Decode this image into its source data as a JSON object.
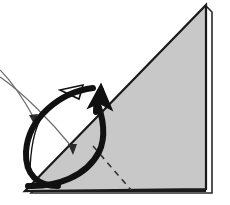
{
  "figure": {
    "canvas": {
      "width": 230,
      "height": 205
    },
    "background_color": "#ffffff"
  },
  "colors": {
    "paper_fill": "#c8c8c8",
    "paper_outline": "#1a1a1a",
    "back_sheet_fill": "#fdfdfd",
    "back_sheet_outline": "#2a2a2a",
    "crease_dashed": "#333333",
    "thick_arrow": "#111111",
    "thin_arrow": "#6b6b6b",
    "hollow_arrow_outline": "#111111",
    "hollow_arrow_fill": "#ffffff"
  },
  "shapes": {
    "back_sheet": {
      "name": "back-sheet",
      "points": "31,193 212,193 212,12 206,6",
      "note": "thin white layer of paper peeking behind the shaded triangle at the right edge"
    },
    "paper_triangle": {
      "name": "paper-triangle",
      "points": "25,191 206,5 206,189",
      "note": "main shaded right triangle; apex top-right, bottom-left corner, bottom-right corner"
    },
    "base_edge": {
      "name": "base-edge",
      "from": [
        25,
        191
      ],
      "to": [
        206,
        191
      ]
    },
    "crease_line": {
      "name": "crease-dashed-line",
      "from": [
        93,
        146
      ],
      "to": [
        131,
        190
      ],
      "dash": "6,5",
      "width": 1.6
    }
  },
  "arrows": {
    "thick_rotation_loop": {
      "name": "thick-rotation-arrow",
      "stroke_width": 6,
      "tip": [
        101,
        84
      ],
      "note": "heavy black looping arrow showing the paper rotating up and over"
    },
    "hollow_arrowhead": {
      "name": "hollow-arrowhead",
      "points": "83,85 60,90 79,99",
      "note": "small unfilled triangular arrowhead at top of thin loop"
    },
    "thin_loop": {
      "name": "thin-loop-arrow",
      "stroke_width": 1.3
    },
    "pointer_upper": {
      "name": "pointer-arrow-upper",
      "from": [
        0,
        70
      ],
      "tip": [
        34,
        124
      ],
      "stroke_width": 1.2
    },
    "pointer_lower": {
      "name": "pointer-arrow-lower",
      "from": [
        0,
        77
      ],
      "tip": [
        75,
        155
      ],
      "stroke_width": 1.2
    }
  }
}
